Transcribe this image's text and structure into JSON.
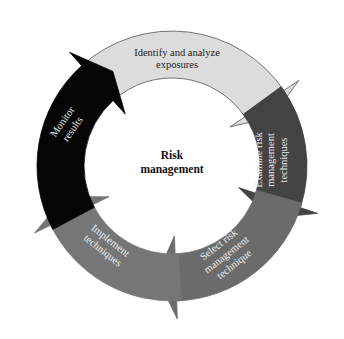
{
  "diagram": {
    "center": {
      "lines": [
        "Risk",
        "management"
      ],
      "x": 172,
      "y": 165
    },
    "geometry": {
      "cx": 172,
      "cy": 166,
      "r_outer": 135,
      "r_inner": 88,
      "head_extra": 18
    },
    "steps": [
      {
        "id": "identify",
        "lines": [
          "Identify and analyze",
          "exposures"
        ],
        "fill": "#dcdcdc",
        "stroke": "#555555",
        "text_color": "#222222",
        "start": -42,
        "end": 56,
        "tip": 64,
        "label_x": 177,
        "label_y": 58,
        "label_rot": 0
      },
      {
        "id": "examine",
        "lines": [
          "Examine risk",
          "management",
          "techniques"
        ],
        "fill": "#434343",
        "stroke": "#434343",
        "text_color": "#e8e8e8",
        "start": 54,
        "end": 108,
        "tip": 118,
        "label_x": 270,
        "label_y": 160,
        "label_rot": -90
      },
      {
        "id": "select",
        "lines": [
          "Select risk",
          "management",
          "technique"
        ],
        "fill": "#6b6b6b",
        "stroke": "#6b6b6b",
        "text_color": "#eeeeee",
        "start": 106,
        "end": 178,
        "tip": 188,
        "label_x": 226,
        "label_y": 254,
        "label_rot": -38
      },
      {
        "id": "implement",
        "lines": [
          "Implement",
          "techniques"
        ],
        "fill": "#767676",
        "stroke": "#767676",
        "text_color": "#eeeeee",
        "start": 176,
        "end": 244,
        "tip": 254,
        "label_x": 107,
        "label_y": 245,
        "label_rot": 38
      },
      {
        "id": "monitor",
        "lines": [
          "Monitor",
          "results"
        ],
        "fill": "#050505",
        "stroke": "#050505",
        "text_color": "#e6e6e6",
        "start": 242,
        "end": 318,
        "tip": 328,
        "label_x": 67,
        "label_y": 125,
        "label_rot": -55
      }
    ]
  }
}
